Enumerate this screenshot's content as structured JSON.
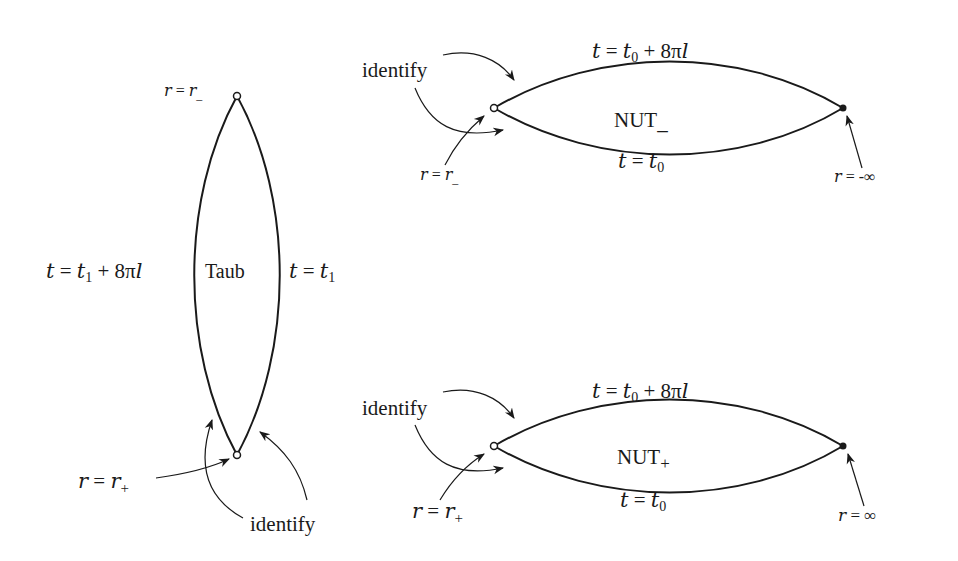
{
  "diagram": {
    "type": "penrose-style conformal diagrams",
    "taub": {
      "region_label": "Taub",
      "top_point_label": "r = r_",
      "bottom_point_label": "r = r+",
      "left_edge_label": "t = t1 + 8πl",
      "right_edge_label": "t = t1",
      "identify_label": "identify"
    },
    "nut_minus": {
      "region_label": "NUT_",
      "top_edge_label": "t = t0 + 8πl",
      "bottom_edge_label": "t = t0",
      "left_point_label": "r = r_",
      "right_point_label": "r = -∞",
      "identify_label": "identify"
    },
    "nut_plus": {
      "region_label": "NUT+",
      "top_edge_label": "t = t0 + 8πl",
      "bottom_edge_label": "t = t0",
      "left_point_label": "r = r+",
      "right_point_label": "r = ∞",
      "identify_label": "identify"
    }
  },
  "text": {
    "taub_region": "Taub",
    "taub_left_t": "t",
    "taub_left_eq": " = ",
    "taub_left_t1": "t",
    "taub_left_sub1": "1",
    "taub_left_plus": " + 8π",
    "taub_left_l": "l",
    "taub_right_t": "t",
    "taub_right_eq": " = ",
    "taub_right_t1": "t",
    "taub_right_sub1": "1",
    "r": "r",
    "eq": " = ",
    "minus_sub": "_",
    "plus_sub": "+",
    "identify": "identify",
    "nut": "NUT",
    "t": "t",
    "sub0": "0",
    "plus8pi": " + 8π",
    "l": "l",
    "neg_inf": "-∞",
    "inf": "∞"
  }
}
